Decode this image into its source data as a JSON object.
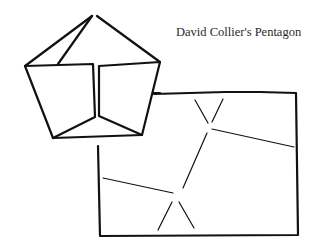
{
  "figure": {
    "title": "David Collier's Pentagon",
    "ink_color": "#111111",
    "background": "#ffffff"
  }
}
